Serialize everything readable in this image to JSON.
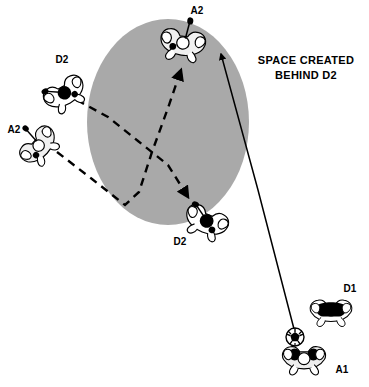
{
  "diagram": {
    "background_color": "#ffffff",
    "annotation": {
      "line1": "SPACE CREATED",
      "line2": "BEHIND D2",
      "x": 306,
      "y": 64,
      "color": "#000000"
    },
    "zone": {
      "name": "shaded-space-zone",
      "shape": "ellipse",
      "cx": 168,
      "cy": 122,
      "rx": 81,
      "ry": 103,
      "fill": "#a9a9a9"
    },
    "players": [
      {
        "id": "a2-top",
        "label": "A2",
        "team": "attack",
        "fill": "#f2f2f2",
        "label_x": 197,
        "label_y": 14,
        "x": 183,
        "y": 42,
        "rotation": 10
      },
      {
        "id": "d2-upper-left",
        "label": "D2",
        "team": "defense",
        "fill": "#ffffff",
        "label_x": 62,
        "label_y": 63,
        "x": 64,
        "y": 92,
        "rotation": -35
      },
      {
        "id": "a2-left",
        "label": "A2",
        "team": "attack",
        "fill": "#f2f2f2",
        "label_x": 14,
        "label_y": 133,
        "x": 38,
        "y": 145,
        "rotation": -45
      },
      {
        "id": "d2-lower",
        "label": "D2",
        "team": "defense",
        "fill": "#ffffff",
        "label_x": 180,
        "label_y": 243,
        "x": 207,
        "y": 220,
        "rotation": 25
      },
      {
        "id": "d1-right",
        "label": "D1",
        "team": "defense",
        "fill": "#ffffff",
        "label_x": 348,
        "label_y": 292,
        "x": 331,
        "y": 310,
        "rotation": 0
      },
      {
        "id": "a1-ball-carrier",
        "label": "A1",
        "team": "attack",
        "fill": "#f2f2f2",
        "label_x": 340,
        "label_y": 371,
        "x": 304,
        "y": 355,
        "rotation": 0,
        "has_ball": true
      }
    ],
    "ball": {
      "name": "soccer-ball",
      "cx": 295,
      "cy": 337,
      "r": 9
    },
    "movements": [
      {
        "name": "d2-recovery-path",
        "style": "dashed",
        "from": "d2-upper-left",
        "to": "d2-lower",
        "points": "77,100 108,117 138,141 168,165 188,197",
        "arrowhead": true
      },
      {
        "name": "a2-cut-path",
        "style": "dashed",
        "from": "a2-left",
        "to": "a2-top",
        "points": "57,152 92,179 125,205 139,192 152,152 168,108 181,70",
        "arrowhead": true
      },
      {
        "name": "pass-line",
        "style": "solid",
        "from": "a1-ball-carrier",
        "to": "a2-top",
        "points": "294,329 258,190 220,52",
        "arrowhead": true
      }
    ]
  }
}
